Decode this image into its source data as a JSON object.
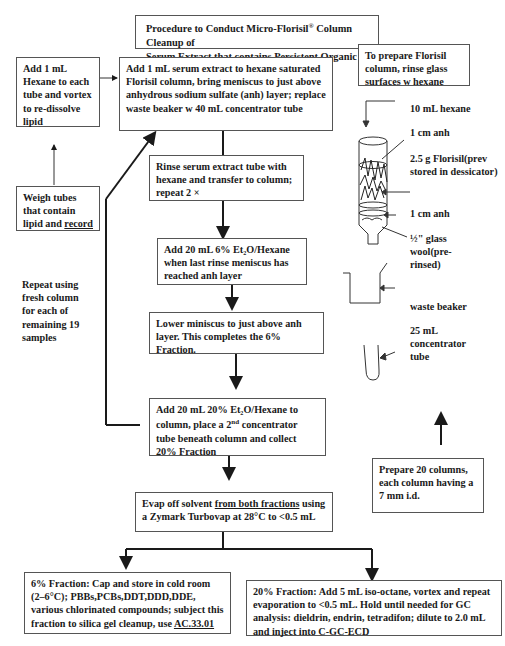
{
  "title": {
    "line1_pre": "Procedure to Conduct Micro-Florisil",
    "line1_sup": "®",
    "line1_post": " Column Cleanup of",
    "line2": "Serum Extract that contains Persistent Organic Pollutants"
  },
  "steps": {
    "add_hexane": "Add 1 mL Hexane to each tube and vortex to re-dissolve lipid",
    "weigh_tubes_pre": "Weigh tubes that contain lipid and ",
    "weigh_tubes_link": "record",
    "add_serum": "Add 1 mL serum extract to hexane saturated Florisil column, bring meniscus to just above anhydrous sodium sulfate (anh) layer; replace waste beaker w 40 mL concentrator tube",
    "rinse": "Rinse serum extract tube with hexane and transfer to column; repeat 2 ×",
    "add_6pct": "Add 20 mL 6% Et₂O/Hexane when last rinse meniscus has reached anh layer",
    "lower_meniscus": "Lower miniscus to just above anh layer. This completes the 6% Fraction.",
    "add_20pct_pre": "Add 20 mL 20% Et₂O/Hexane to column, place a 2",
    "add_20pct_sup": "nd",
    "add_20pct_post": " concentrator tube beneath column and collect 20% Fraction",
    "evap_pre": "Evap off solvent ",
    "evap_underlined": "from both fractions",
    "evap_post": " using a Zymark Turbovap at 28°C to <0.5 mL",
    "fraction6_pre": "6% Fraction: Cap and store in cold room (2–6°C); PBBs,PCBs,DDT,DDD,DDE, various chlorinated compounds; subject this fraction to silica gel cleanup, use ",
    "fraction6_link": "AC.33.01",
    "fraction20": "20% Fraction: Add 5 mL iso-octane, vortex and repeat evaporation to <0.5 mL.  Hold until needed for GC analysis: dieldrin, endrin, tetradifon; dilute to 2.0 mL and inject into C-GC-ECD"
  },
  "repeat_note": "Repeat using fresh column for each of remaining 19 samples",
  "prep": {
    "box": "To prepare Florisil column, rinse glass surfaces w hexane",
    "prepare_columns": "Prepare 20 columns, each column having a 7 mm i.d."
  },
  "column_labels": {
    "hexane": "10 mL hexane",
    "anh_top": "1 cm anh",
    "florisil": "2.5 g Florisil(prev stored in dessicator)",
    "anh_bottom": "1 cm anh",
    "glass_wool": "½\" glass wool(pre-rinsed)",
    "waste_beaker": "waste beaker",
    "concentrator": "25 mL concentrator tube"
  }
}
